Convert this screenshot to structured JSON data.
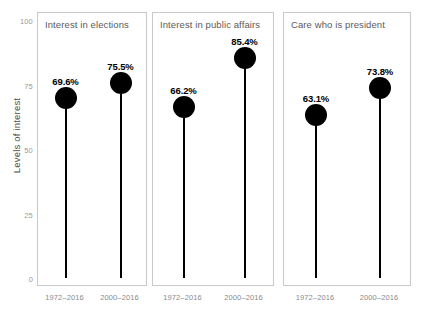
{
  "chart_data": {
    "type": "bar",
    "title": "",
    "xlabel": "",
    "ylabel": "Levels of interest",
    "ylim": [
      0,
      100
    ],
    "yticks": [
      0,
      25,
      50,
      75,
      100
    ],
    "ytick_labels": [
      "0",
      "25",
      "50",
      "75",
      "100"
    ],
    "grid": false,
    "legend": "none",
    "categories": [
      "1972–2016",
      "2000–2016"
    ],
    "panels": [
      {
        "title": "Interest in elections",
        "points": [
          {
            "category": "1972–2016",
            "value": 69.6,
            "label": "69.6%"
          },
          {
            "category": "2000–2016",
            "value": 75.5,
            "label": "75.5%"
          }
        ]
      },
      {
        "title": "Interest in public affairs",
        "points": [
          {
            "category": "1972–2016",
            "value": 66.2,
            "label": "66.2%"
          },
          {
            "category": "2000–2016",
            "value": 85.4,
            "label": "85.4%"
          }
        ]
      },
      {
        "title": "Care who is president",
        "points": [
          {
            "category": "1972–2016",
            "value": 63.1,
            "label": "63.1%"
          },
          {
            "category": "2000–2016",
            "value": 73.8,
            "label": "73.8%"
          }
        ]
      }
    ],
    "colors": {
      "marker": "#000000",
      "stem": "#000000",
      "panel_border": "#c9c9c9",
      "tick_text": "#9a9a9a",
      "panel_title_text": "#5a5a5a",
      "axis_title_text": "#4a4a4a",
      "background": "#ffffff"
    }
  }
}
